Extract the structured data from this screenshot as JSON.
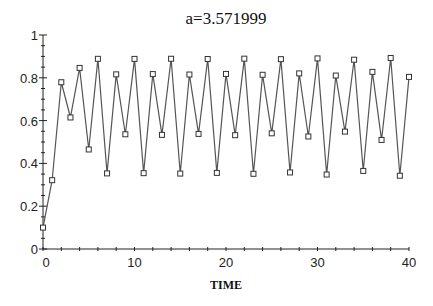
{
  "chart_data": {
    "type": "line",
    "title": "a=3.571999",
    "xlabel": "TIME",
    "ylabel": "",
    "xlim": [
      0,
      40
    ],
    "ylim": [
      0,
      1
    ],
    "grid": false,
    "legend": null,
    "marker": "square",
    "x_ticks": [
      0,
      10,
      20,
      30,
      40
    ],
    "x_tick_labels": [
      "0",
      "10",
      "20",
      "30",
      "40"
    ],
    "y_ticks": [
      0,
      0.2,
      0.4,
      0.6,
      0.8,
      1
    ],
    "y_tick_labels": [
      "0",
      "0.2",
      "0.4",
      "0.6",
      "0.8",
      "1"
    ],
    "x": [
      0,
      1,
      2,
      3,
      4,
      5,
      6,
      7,
      8,
      9,
      10,
      11,
      12,
      13,
      14,
      15,
      16,
      17,
      18,
      19,
      20,
      21,
      22,
      23,
      24,
      25,
      26,
      27,
      28,
      29,
      30,
      31,
      32,
      33,
      34,
      35,
      36,
      37,
      38,
      39,
      40
    ],
    "series": [
      {
        "name": "x(t)",
        "values": [
          0.1,
          0.3215,
          0.7792,
          0.6146,
          0.8461,
          0.4651,
          0.8887,
          0.3533,
          0.8161,
          0.5361,
          0.8883,
          0.3544,
          0.8173,
          0.5334,
          0.889,
          0.3525,
          0.8153,
          0.5379,
          0.8879,
          0.3556,
          0.8181,
          0.5318,
          0.8894,
          0.3514,
          0.8141,
          0.5406,
          0.8871,
          0.3577,
          0.8206,
          0.5258,
          0.8906,
          0.348,
          0.8105,
          0.5486,
          0.8845,
          0.3648,
          0.8276,
          0.5096,
          0.8926,
          0.3424,
          0.8043
        ]
      }
    ]
  },
  "colors": {
    "line": "#555555",
    "axis": "#222222",
    "marker_stroke": "#333333",
    "background": "#ffffff"
  }
}
